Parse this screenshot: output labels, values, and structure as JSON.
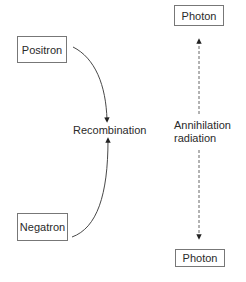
{
  "diagram": {
    "nodes": {
      "positron": {
        "label": "Positron"
      },
      "negatron": {
        "label": "Negatron"
      },
      "photon_top": {
        "label": "Photon"
      },
      "photon_bottom": {
        "label": "Photon"
      }
    },
    "labels": {
      "recombination": "Recombination",
      "annihilation_line1": "Annihilation",
      "annihilation_line2": "radiation"
    },
    "edges": [
      {
        "from": "positron",
        "to": "recombination",
        "style": "solid-curve"
      },
      {
        "from": "negatron",
        "to": "recombination",
        "style": "solid-curve"
      },
      {
        "from": "annihilation",
        "to": "photon_top",
        "style": "dashed"
      },
      {
        "from": "annihilation",
        "to": "photon_bottom",
        "style": "dashed"
      }
    ],
    "colors": {
      "line": "#333333",
      "box_border": "#777777"
    }
  }
}
